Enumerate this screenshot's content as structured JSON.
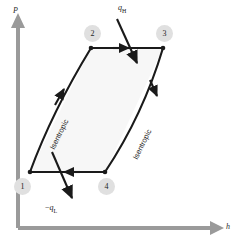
{
  "figure": {
    "title_fragment": "",
    "background": "#ffffff"
  },
  "axes": {
    "y_label": "P",
    "x_label": "h",
    "color": "#9a9a9a",
    "origin": {
      "x": 18,
      "y": 228
    },
    "y_top": {
      "x": 18,
      "y": 18
    },
    "x_right": {
      "x": 222,
      "y": 228
    }
  },
  "cycle": {
    "fill_color": "#f7f7f7",
    "stroke_color": "#1a1a1a",
    "vertices": [
      {
        "id": "1",
        "x": 30,
        "y": 172
      },
      {
        "id": "2",
        "x": 91,
        "y": 48
      },
      {
        "id": "3",
        "x": 163,
        "y": 48
      },
      {
        "id": "4",
        "x": 105,
        "y": 172
      }
    ]
  },
  "state_points": [
    {
      "label": "1",
      "cx": 22,
      "cy": 186
    },
    {
      "label": "2",
      "cx": 92,
      "cy": 33
    },
    {
      "label": "3",
      "cx": 164,
      "cy": 33
    },
    {
      "label": "4",
      "cx": 106,
      "cy": 186
    }
  ],
  "process_labels": [
    {
      "text": "Isentropic",
      "x": 48,
      "y": 147,
      "rotate": -64
    },
    {
      "text": "Isentropic",
      "x": 131,
      "y": 157,
      "rotate": -64
    }
  ],
  "heat_flows": [
    {
      "name": "heat-in",
      "text_html": "q_H",
      "symbol": "q",
      "subscript": "H",
      "sign": "",
      "label_x": 118,
      "label_y": 6,
      "arrow_from": {
        "x": 117,
        "y": 19
      },
      "arrow_to": {
        "x": 137,
        "y": 63
      }
    },
    {
      "name": "heat-out",
      "text_html": "-q_L",
      "symbol": "q",
      "subscript": "L",
      "sign": "−",
      "label_x": 47,
      "label_y": 205,
      "arrow_from": {
        "x": 52,
        "y": 152
      },
      "arrow_to": {
        "x": 72,
        "y": 198
      }
    }
  ],
  "flow_arrows": [
    {
      "name": "top-edge-arrow",
      "direction": "right"
    },
    {
      "name": "bottom-edge-arrow",
      "direction": "left"
    },
    {
      "name": "left-edge-arrow",
      "direction": "up-right"
    },
    {
      "name": "right-edge-arrow",
      "direction": "down-right"
    }
  ]
}
